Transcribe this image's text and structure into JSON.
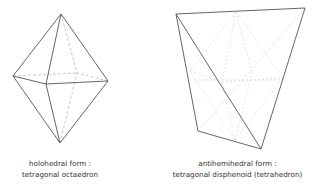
{
  "figures": [
    {
      "id": "octahedron",
      "caption_line1": "holohedral form :",
      "caption_line2": "tetragonal octaedron"
    },
    {
      "id": "disphenoid",
      "caption_line1": "antihemihedral form :",
      "caption_line2": "tetragonal disphenoid (tetrahedron)"
    }
  ],
  "colors": {
    "solid_edge": "#555555",
    "hidden_edge": "#bbbbbb",
    "inner_edge": "#d8d8d8",
    "text": "#333333"
  }
}
